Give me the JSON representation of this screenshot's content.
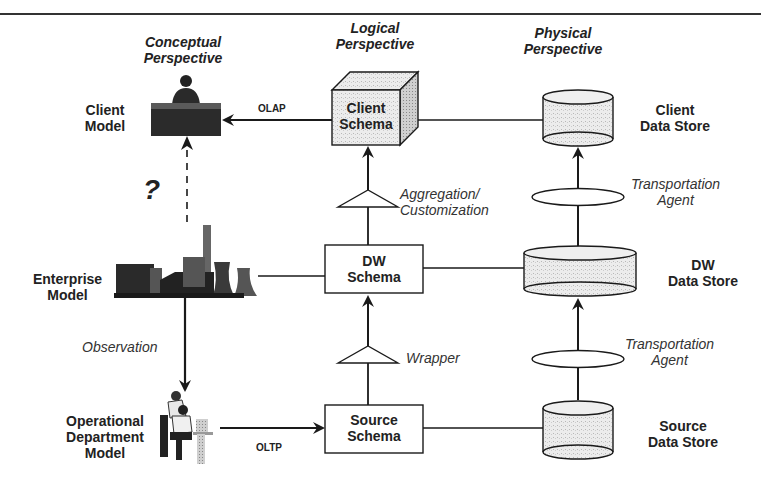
{
  "diagram": {
    "perspectives": {
      "conceptual": "Conceptual\nPerspective",
      "logical": "Logical\nPerspective",
      "physical": "Physical\nPerspective"
    },
    "conceptual": {
      "client_model": "Client\nModel",
      "enterprise_model": "Enterprise\nModel",
      "operational_model": "Operational\nDepartment\nModel",
      "question_mark": "?",
      "observation": "Observation"
    },
    "logical": {
      "client_schema": "Client\nSchema",
      "dw_schema": "DW\nSchema",
      "source_schema": "Source\nSchema",
      "aggregation": "Aggregation/\nCustomization",
      "wrapper": "Wrapper"
    },
    "physical": {
      "client_store": "Client\nData Store",
      "dw_store": "DW\nData Store",
      "source_store": "Source\nData Store",
      "transport_top": "Transportation\nAgent",
      "transport_bottom": "Transportation\nAgent"
    },
    "edges": {
      "olap": "OLAP",
      "oltp": "OLTP"
    }
  }
}
